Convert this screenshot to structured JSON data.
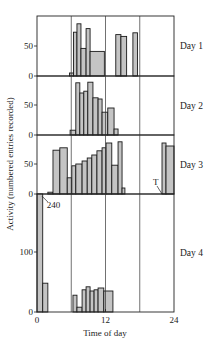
{
  "chart_data": {
    "type": "bar",
    "subtype": "stacked-panel histogram (step)",
    "title": "",
    "xlabel": "Time of day",
    "ylabel": "Activity (numbered entries recorded)",
    "xlim": [
      0,
      24
    ],
    "x_ticks": [
      0,
      12,
      24
    ],
    "x_tick_labels": [
      "0",
      "12",
      "24"
    ],
    "x_gridlines": [
      6,
      12,
      18
    ],
    "bin_hours": 0.75,
    "panels": [
      {
        "name": "Day 1",
        "ylim": [
          0,
          100
        ],
        "y_ticks": [
          0,
          50
        ],
        "y_tick_labels": [
          "0",
          "50"
        ],
        "bins": [
          {
            "start": 5.7,
            "end": 6.4,
            "value": 5
          },
          {
            "start": 6.4,
            "end": 7.0,
            "value": 73
          },
          {
            "start": 7.0,
            "end": 7.7,
            "value": 87
          },
          {
            "start": 7.7,
            "end": 8.6,
            "value": 46
          },
          {
            "start": 8.6,
            "end": 9.3,
            "value": 79
          },
          {
            "start": 9.3,
            "end": 11.8,
            "value": 41
          },
          {
            "start": 13.8,
            "end": 14.7,
            "value": 69
          },
          {
            "start": 14.7,
            "end": 15.7,
            "value": 66
          },
          {
            "start": 16.8,
            "end": 17.6,
            "value": 72
          }
        ],
        "annotations": []
      },
      {
        "name": "Day 2",
        "ylim": [
          0,
          100
        ],
        "y_ticks": [
          0,
          50
        ],
        "y_tick_labels": [
          "0",
          "50"
        ],
        "bins": [
          {
            "start": 5.8,
            "end": 6.8,
            "value": 8
          },
          {
            "start": 6.8,
            "end": 7.5,
            "value": 87
          },
          {
            "start": 7.5,
            "end": 8.2,
            "value": 70
          },
          {
            "start": 8.2,
            "end": 8.9,
            "value": 73
          },
          {
            "start": 8.9,
            "end": 9.8,
            "value": 88
          },
          {
            "start": 9.8,
            "end": 10.7,
            "value": 62
          },
          {
            "start": 10.7,
            "end": 11.4,
            "value": 60
          },
          {
            "start": 11.4,
            "end": 12.4,
            "value": 38
          },
          {
            "start": 12.4,
            "end": 13.5,
            "value": 45
          },
          {
            "start": 13.5,
            "end": 14.2,
            "value": 10
          }
        ],
        "annotations": []
      },
      {
        "name": "Day 3",
        "ylim": [
          0,
          100
        ],
        "y_ticks": [
          0,
          50
        ],
        "y_tick_labels": [
          "0",
          "50"
        ],
        "bins": [
          {
            "start": 1.9,
            "end": 2.8,
            "value": 3
          },
          {
            "start": 2.8,
            "end": 4.0,
            "value": 73
          },
          {
            "start": 4.0,
            "end": 5.3,
            "value": 77
          },
          {
            "start": 5.3,
            "end": 6.1,
            "value": 27
          },
          {
            "start": 6.1,
            "end": 6.8,
            "value": 47
          },
          {
            "start": 6.8,
            "end": 7.9,
            "value": 50
          },
          {
            "start": 7.9,
            "end": 8.8,
            "value": 55
          },
          {
            "start": 8.8,
            "end": 9.6,
            "value": 60
          },
          {
            "start": 9.6,
            "end": 10.5,
            "value": 65
          },
          {
            "start": 10.5,
            "end": 11.4,
            "value": 72
          },
          {
            "start": 11.4,
            "end": 12.1,
            "value": 77
          },
          {
            "start": 12.1,
            "end": 13.1,
            "value": 85
          },
          {
            "start": 13.1,
            "end": 14.2,
            "value": 48
          },
          {
            "start": 14.2,
            "end": 14.9,
            "value": 87
          },
          {
            "start": 14.9,
            "end": 15.4,
            "value": 10
          },
          {
            "start": 21.9,
            "end": 22.6,
            "value": 85
          },
          {
            "start": 22.6,
            "end": 24.0,
            "value": 80
          }
        ],
        "annotations": [
          {
            "text": "T",
            "x": 21.9,
            "y": 0
          }
        ]
      },
      {
        "name": "Day 4",
        "ylim": [
          0,
          195
        ],
        "y_ticks": [
          0,
          100
        ],
        "y_tick_labels": [
          "0",
          "100"
        ],
        "bins": [
          {
            "start": 0.0,
            "end": 1.0,
            "value": 240,
            "clipped": true
          },
          {
            "start": 1.0,
            "end": 1.9,
            "value": 48
          },
          {
            "start": 6.3,
            "end": 7.0,
            "value": 28
          },
          {
            "start": 7.0,
            "end": 7.9,
            "value": 8
          },
          {
            "start": 7.9,
            "end": 8.6,
            "value": 37
          },
          {
            "start": 8.6,
            "end": 9.3,
            "value": 42
          },
          {
            "start": 9.3,
            "end": 10.0,
            "value": 35
          },
          {
            "start": 10.0,
            "end": 10.7,
            "value": 37
          },
          {
            "start": 10.7,
            "end": 11.7,
            "value": 40
          },
          {
            "start": 11.7,
            "end": 13.3,
            "value": 35
          }
        ],
        "annotations": [
          {
            "text": "240",
            "x": 0.5,
            "y": 240
          }
        ]
      }
    ]
  }
}
